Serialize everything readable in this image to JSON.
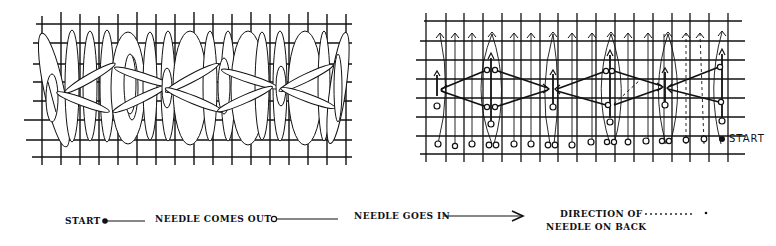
{
  "figure": {
    "left_panel": {
      "description": "finished stitch"
    },
    "right_panel": {
      "description": "stitch diagram",
      "start_label": "START"
    },
    "legend": {
      "start": "START",
      "needle_out": "NEEDLE COMES OUT",
      "needle_in": "NEEDLE GOES IN",
      "direction_line1": "DIRECTION OF",
      "direction_line2": "NEEDLE ON BACK"
    },
    "colors": {
      "ink": "#111111",
      "paper": "#ffffff"
    }
  }
}
